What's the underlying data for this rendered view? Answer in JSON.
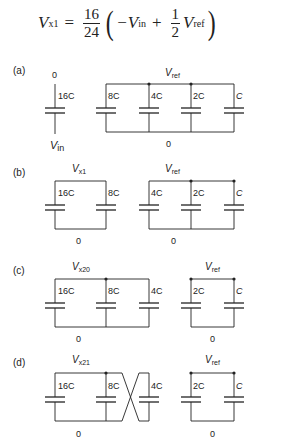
{
  "equation": {
    "lhs_var": "V",
    "lhs_sub": "x1",
    "equals": "=",
    "frac_num": "16",
    "frac_den": "24",
    "minus_var": "−V",
    "minus_sub": "in",
    "plus": "+",
    "half_num": "1",
    "half_den": "2",
    "ref_var": "V",
    "ref_sub": "ref",
    "open_paren": "(",
    "close_paren": ")"
  },
  "panels": [
    {
      "label": "(a)",
      "top_labels": [
        {
          "text": "0"
        },
        {
          "var": "V",
          "sub": "ref"
        }
      ],
      "bottom_labels": [
        {
          "var": "V",
          "sub": "in"
        },
        {
          "text": "0"
        }
      ],
      "capacitors": [
        "16C",
        "8C",
        "4C",
        "2C",
        "C"
      ]
    },
    {
      "label": "(b)",
      "top_labels": [
        {
          "var": "V",
          "sub": "x1"
        },
        {
          "var": "V",
          "sub": "ref"
        }
      ],
      "bottom_labels": [
        {
          "text": "0"
        },
        {
          "text": "0"
        }
      ],
      "capacitors": [
        "16C",
        "8C",
        "4C",
        "2C",
        "C"
      ]
    },
    {
      "label": "(c)",
      "top_labels": [
        {
          "var": "V",
          "sub": "x20"
        },
        {
          "var": "V",
          "sub": "ref"
        }
      ],
      "bottom_labels": [
        {
          "text": "0"
        },
        {
          "text": "0"
        }
      ],
      "capacitors": [
        "16C",
        "8C",
        "4C",
        "2C",
        "C"
      ]
    },
    {
      "label": "(d)",
      "top_labels": [
        {
          "var": "V",
          "sub": "x21"
        },
        {
          "var": "V",
          "sub": "ref"
        }
      ],
      "bottom_labels": [
        {
          "text": "0"
        },
        {
          "text": "0"
        }
      ],
      "capacitors": [
        "16C",
        "8C",
        "4C",
        "2C",
        "C"
      ]
    }
  ],
  "colors": {
    "ink": "#222222",
    "background": "#ffffff"
  }
}
